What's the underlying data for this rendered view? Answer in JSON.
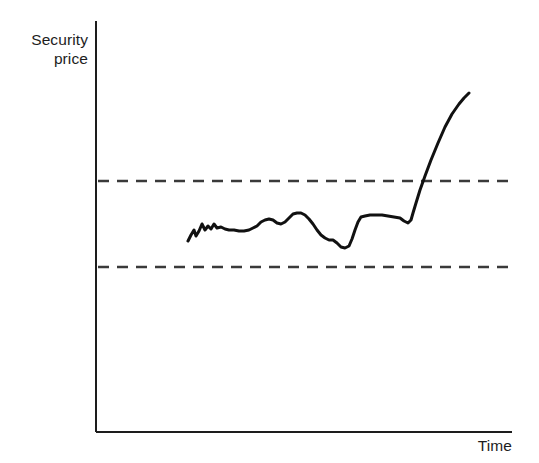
{
  "chart_data": {
    "type": "line",
    "title": "",
    "subtitle": "",
    "xlabel": "Time",
    "ylabel": "Security price",
    "grid": false,
    "legend": null,
    "axes": {
      "x_axis": {
        "drawn": true,
        "ticks": [],
        "tick_labels": [],
        "range_px": [
          96,
          512
        ],
        "y_px": 432
      },
      "y_axis": {
        "drawn": true,
        "ticks": [],
        "tick_labels": [],
        "range_px": [
          21,
          432
        ],
        "x_px": 96
      }
    },
    "annotations": [
      {
        "name": "resistance-line",
        "style": "dashed",
        "orientation": "horizontal",
        "y_px": 181,
        "x_start_px": 98,
        "x_end_px": 512,
        "label": ""
      },
      {
        "name": "support-line",
        "style": "dashed",
        "orientation": "horizontal",
        "y_px": 267,
        "x_start_px": 98,
        "x_end_px": 512,
        "label": ""
      }
    ],
    "series": [
      {
        "name": "security-price",
        "color": "#111111",
        "points_px": [
          [
            188,
            241
          ],
          [
            191,
            235
          ],
          [
            194,
            230
          ],
          [
            196,
            236
          ],
          [
            199,
            231
          ],
          [
            202,
            224
          ],
          [
            205,
            230
          ],
          [
            208,
            226
          ],
          [
            211,
            229
          ],
          [
            214,
            224
          ],
          [
            217,
            228
          ],
          [
            221,
            227
          ],
          [
            225,
            229
          ],
          [
            229,
            230
          ],
          [
            234,
            230
          ],
          [
            239,
            231
          ],
          [
            244,
            231
          ],
          [
            249,
            230
          ],
          [
            253,
            228
          ],
          [
            257,
            226
          ],
          [
            261,
            222
          ],
          [
            265,
            220
          ],
          [
            269,
            219
          ],
          [
            273,
            220
          ],
          [
            277,
            223
          ],
          [
            281,
            224
          ],
          [
            285,
            222
          ],
          [
            289,
            218
          ],
          [
            293,
            214
          ],
          [
            297,
            213
          ],
          [
            301,
            213
          ],
          [
            305,
            215
          ],
          [
            309,
            219
          ],
          [
            313,
            224
          ],
          [
            317,
            230
          ],
          [
            321,
            235
          ],
          [
            325,
            238
          ],
          [
            329,
            240
          ],
          [
            333,
            240
          ],
          [
            337,
            243
          ],
          [
            341,
            247
          ],
          [
            345,
            248
          ],
          [
            349,
            246
          ],
          [
            352,
            239
          ],
          [
            355,
            230
          ],
          [
            358,
            222
          ],
          [
            361,
            217
          ],
          [
            365,
            216
          ],
          [
            370,
            215
          ],
          [
            376,
            215
          ],
          [
            382,
            215
          ],
          [
            388,
            216
          ],
          [
            394,
            217
          ],
          [
            400,
            218
          ],
          [
            404,
            221
          ],
          [
            408,
            223
          ],
          [
            411,
            220
          ],
          [
            413,
            213
          ],
          [
            416,
            203
          ],
          [
            420,
            190
          ],
          [
            425,
            176
          ],
          [
            431,
            160
          ],
          [
            438,
            143
          ],
          [
            445,
            127
          ],
          [
            452,
            114
          ],
          [
            459,
            104
          ],
          [
            464,
            98
          ],
          [
            469,
            93
          ]
        ]
      }
    ]
  },
  "y_axis_label_text": "Security\nprice",
  "x_axis_label_text": "Time",
  "colors": {
    "line": "#111111",
    "axis": "#1d1d1d",
    "dash": "#3a3a3a",
    "background": "#ffffff"
  }
}
